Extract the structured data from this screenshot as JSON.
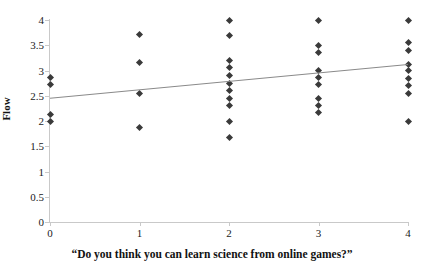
{
  "chart_data": {
    "type": "scatter",
    "title": "",
    "xlabel": "“Do you think you can learn science from online games?”",
    "ylabel": "Flow",
    "xlim": [
      0,
      4
    ],
    "ylim": [
      0,
      4
    ],
    "grid": false,
    "legend": null,
    "x_ticks": [
      "0",
      "1",
      "2",
      "3",
      "4"
    ],
    "x_tick_values": [
      0,
      1,
      2,
      3,
      4
    ],
    "y_ticks": [
      "0",
      "0.5",
      "1",
      "1.5",
      "2",
      "2.5",
      "3",
      "3.5",
      "4"
    ],
    "y_tick_values": [
      0,
      0.5,
      1,
      1.5,
      2,
      2.5,
      3,
      3.5,
      4
    ],
    "marker": "diamond",
    "marker_color": "#3a3a3a",
    "points": [
      {
        "x": 0,
        "y": 2.87
      },
      {
        "x": 0,
        "y": 2.72
      },
      {
        "x": 0,
        "y": 2.13
      },
      {
        "x": 0,
        "y": 2.0
      },
      {
        "x": 1,
        "y": 3.72
      },
      {
        "x": 1,
        "y": 3.15
      },
      {
        "x": 1,
        "y": 2.55
      },
      {
        "x": 1,
        "y": 1.87
      },
      {
        "x": 2,
        "y": 4.0
      },
      {
        "x": 2,
        "y": 3.7
      },
      {
        "x": 2,
        "y": 3.2
      },
      {
        "x": 2,
        "y": 3.05
      },
      {
        "x": 2,
        "y": 2.9
      },
      {
        "x": 2,
        "y": 2.75
      },
      {
        "x": 2,
        "y": 2.6
      },
      {
        "x": 2,
        "y": 2.45
      },
      {
        "x": 2,
        "y": 2.3
      },
      {
        "x": 2,
        "y": 2.0
      },
      {
        "x": 2,
        "y": 1.68
      },
      {
        "x": 3,
        "y": 4.0
      },
      {
        "x": 3,
        "y": 3.5
      },
      {
        "x": 3,
        "y": 3.35
      },
      {
        "x": 3,
        "y": 3.0
      },
      {
        "x": 3,
        "y": 2.87
      },
      {
        "x": 3,
        "y": 2.72
      },
      {
        "x": 3,
        "y": 2.45
      },
      {
        "x": 3,
        "y": 2.3
      },
      {
        "x": 3,
        "y": 2.17
      },
      {
        "x": 4,
        "y": 4.0
      },
      {
        "x": 4,
        "y": 3.55
      },
      {
        "x": 4,
        "y": 3.4
      },
      {
        "x": 4,
        "y": 3.12
      },
      {
        "x": 4,
        "y": 3.0
      },
      {
        "x": 4,
        "y": 2.85
      },
      {
        "x": 4,
        "y": 2.7
      },
      {
        "x": 4,
        "y": 2.55
      },
      {
        "x": 4,
        "y": 2.0
      }
    ],
    "trendline": {
      "type": "linear",
      "color": "#8a8a8a",
      "x_start": 0,
      "y_start": 2.45,
      "x_end": 4,
      "y_end": 3.12
    }
  }
}
